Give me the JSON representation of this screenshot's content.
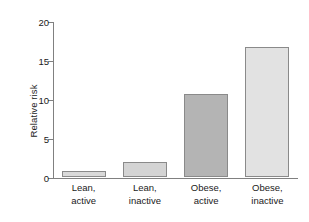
{
  "chart_data": {
    "type": "bar",
    "title": "",
    "subtitle": "",
    "xlabel": "",
    "ylabel": "Relative risk",
    "ylim": [
      0,
      20
    ],
    "yticks": [
      0,
      5,
      10,
      15,
      20
    ],
    "ytick_labels": [
      "0",
      "5",
      "10",
      "15",
      "20"
    ],
    "grid": false,
    "legend": null,
    "categories": [
      "Lean, active",
      "Lean, inactive",
      "Obese, active",
      "Obese, inactive"
    ],
    "category_lines": [
      [
        "Lean,",
        "active"
      ],
      [
        "Lean,",
        "inactive"
      ],
      [
        "Obese,",
        "active"
      ],
      [
        "Obese,",
        "inactive"
      ]
    ],
    "values": [
      0.8,
      1.9,
      10.7,
      16.7
    ],
    "bar_colors": [
      "#d9d9d9",
      "#d4d4d4",
      "#b4b4b4",
      "#e2e2e2"
    ],
    "bar_edge_color": "#8a8a8a",
    "axis_color": "#808080",
    "text_color": "#1a1a1a",
    "background": "#ffffff"
  }
}
